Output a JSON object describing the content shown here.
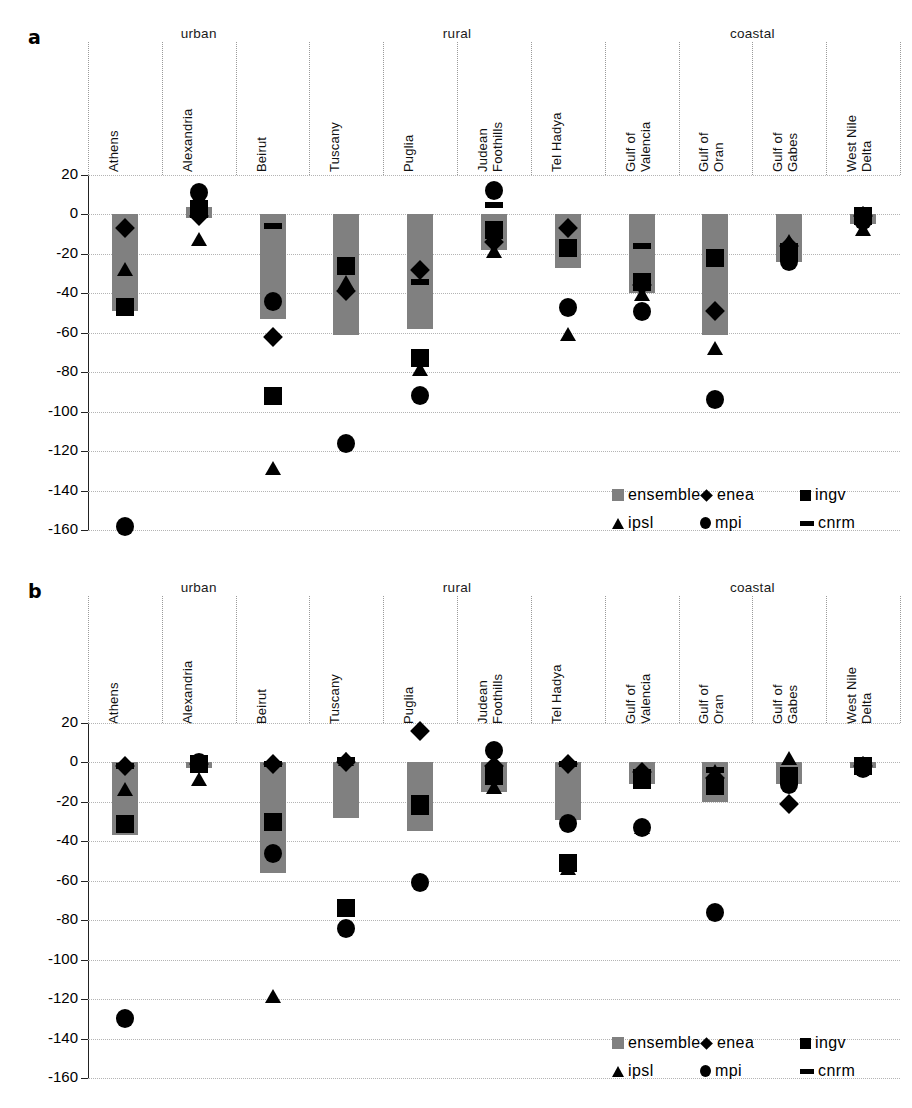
{
  "figure": {
    "panels": [
      {
        "letter": "a"
      },
      {
        "letter": "b"
      }
    ],
    "groups": [
      {
        "label": "urban",
        "span": [
          0,
          2
        ]
      },
      {
        "label": "rural",
        "span": [
          3,
          6
        ]
      },
      {
        "label": "coastal",
        "span": [
          7,
          10
        ]
      }
    ],
    "categories": [
      "Athens",
      "Alexandria",
      "Beirut",
      "Tuscany",
      "Puglia",
      "Judean\nFoothills",
      "Tel Hadya",
      "Gulf of\nValencia",
      "Gulf of\nOran",
      "Gulf of\nGabes",
      "West Nile\nDelta"
    ],
    "legend": [
      {
        "key": "ensemble",
        "label": "ensemble",
        "marker": "ensemble-swatch"
      },
      {
        "key": "enea",
        "label": "enea",
        "marker": "diamond"
      },
      {
        "key": "ingv",
        "label": "ingv",
        "marker": "square"
      },
      {
        "key": "ipsl",
        "label": "ipsl",
        "marker": "triangle"
      },
      {
        "key": "mpi",
        "label": "mpi",
        "marker": "circle"
      },
      {
        "key": "cnrm",
        "label": "cnrm",
        "marker": "dash"
      }
    ],
    "colors": {
      "ensemble_bar": "#808080",
      "marker": "#000000",
      "grid": "#b4b4b4",
      "axis": "#222222"
    }
  },
  "chart_data": [
    {
      "type": "scatter",
      "panel": "a",
      "title": "",
      "xlabel": "",
      "ylabel": "",
      "ylim": [
        -160,
        20
      ],
      "yticks": [
        20,
        0,
        -20,
        -40,
        -60,
        -80,
        -100,
        -120,
        -140,
        -160
      ],
      "ytick_labels": [
        "20",
        "0",
        "-20",
        "-40",
        "-60",
        "-80",
        "-100",
        "-120",
        "-140",
        "-160"
      ],
      "grid": true,
      "legend_position": "lower-right",
      "categories": [
        "Athens",
        "Alexandria",
        "Beirut",
        "Tuscany",
        "Puglia",
        "Judean Foothills",
        "Tel Hadya",
        "Gulf of Valencia",
        "Gulf of Oran",
        "Gulf of Gabes",
        "West Nile Delta"
      ],
      "ensemble_range": [
        [
          0,
          -49
        ],
        [
          4,
          -2
        ],
        [
          0,
          -53
        ],
        [
          0,
          -61
        ],
        [
          0,
          -58
        ],
        [
          0,
          -18
        ],
        [
          0,
          -27
        ],
        [
          0,
          -40
        ],
        [
          0,
          -61
        ],
        [
          0,
          -24
        ],
        [
          0,
          -5
        ]
      ],
      "series": [
        {
          "name": "enea",
          "marker": "diamond",
          "values": [
            -7,
            -1,
            -62,
            -39,
            -28,
            -14,
            -7,
            -36,
            -49,
            -16,
            -1
          ]
        },
        {
          "name": "ingv",
          "marker": "square",
          "values": [
            -47,
            3,
            -92,
            -26,
            -73,
            -8,
            -17,
            -34,
            -22,
            -19,
            -1
          ]
        },
        {
          "name": "ipsl",
          "marker": "triangle",
          "values": [
            -28,
            -13,
            -129,
            -35,
            -79,
            -19,
            -61,
            -41,
            -68,
            -14,
            -8
          ]
        },
        {
          "name": "mpi",
          "marker": "circle",
          "values": [
            -158,
            11,
            -44,
            -116,
            -92,
            12,
            -47,
            -49,
            -94,
            -24,
            -3
          ]
        },
        {
          "name": "cnrm",
          "marker": "dash",
          "values": [
            -45,
            1,
            -6,
            -25,
            -34,
            5,
            -19,
            -16,
            -22,
            -17,
            0
          ]
        }
      ]
    },
    {
      "type": "scatter",
      "panel": "b",
      "title": "",
      "xlabel": "",
      "ylabel": "",
      "ylim": [
        -160,
        20
      ],
      "yticks": [
        20,
        0,
        -20,
        -40,
        -60,
        -80,
        -100,
        -120,
        -140,
        -160
      ],
      "ytick_labels": [
        "20",
        "0",
        "-20",
        "-40",
        "-60",
        "-80",
        "-100",
        "-120",
        "-140",
        "-160"
      ],
      "grid": true,
      "legend_position": "lower-right",
      "categories": [
        "Athens",
        "Alexandria",
        "Beirut",
        "Tuscany",
        "Puglia",
        "Judean Foothills",
        "Tel Hadya",
        "Gulf of Valencia",
        "Gulf of Oran",
        "Gulf of Gabes",
        "West Nile Delta"
      ],
      "ensemble_range": [
        [
          0,
          -37
        ],
        [
          0,
          -3
        ],
        [
          0,
          -56
        ],
        [
          0,
          -28
        ],
        [
          0,
          -35
        ],
        [
          0,
          -15
        ],
        [
          0,
          -29
        ],
        [
          0,
          -11
        ],
        [
          0,
          -20
        ],
        [
          0,
          -11
        ],
        [
          0,
          -3
        ]
      ],
      "series": [
        {
          "name": "enea",
          "marker": "diamond",
          "values": [
            -2,
            -1,
            -1,
            0,
            16,
            -2,
            -1,
            -5,
            -8,
            -21,
            -2
          ]
        },
        {
          "name": "ingv",
          "marker": "square",
          "values": [
            -31,
            -1,
            -30,
            -74,
            -22,
            -7,
            -51,
            -8,
            -12,
            -7,
            -2
          ]
        },
        {
          "name": "ipsl",
          "marker": "triangle",
          "values": [
            -14,
            -9,
            -119,
            1,
            -60,
            -13,
            -54,
            -33,
            -5,
            2,
            -2
          ]
        },
        {
          "name": "mpi",
          "marker": "circle",
          "values": [
            -130,
            0,
            -46,
            -84,
            -61,
            6,
            -31,
            -33,
            -76,
            -11,
            -3
          ]
        },
        {
          "name": "cnrm",
          "marker": "dash",
          "values": [
            -2,
            -3,
            -1,
            1,
            -18,
            -5,
            -1,
            -12,
            -4,
            -8,
            -2
          ]
        }
      ]
    }
  ]
}
